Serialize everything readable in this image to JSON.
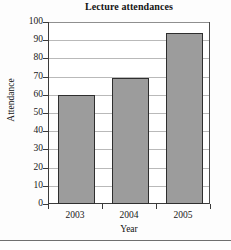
{
  "chart_data": {
    "type": "bar",
    "title": "Lecture attendances",
    "xlabel": "Year",
    "ylabel": "Attendance",
    "categories": [
      "2003",
      "2004",
      "2005"
    ],
    "values": [
      60,
      69,
      94
    ],
    "ylim": [
      0,
      100
    ],
    "ytick_labels": [
      "0",
      "10",
      "20",
      "30",
      "40",
      "50",
      "60",
      "70",
      "80",
      "90",
      "100"
    ],
    "ytick_values": [
      0,
      10,
      20,
      30,
      40,
      50,
      60,
      70,
      80,
      90,
      100
    ],
    "grid": true,
    "legend": false,
    "bar_fill_color": "#9c9c9c",
    "bar_border_color": "#2e2e2e",
    "gridline_color": "#b9b9b9",
    "axis_color": "#3a3a3a",
    "background_color": "#ffffff"
  }
}
